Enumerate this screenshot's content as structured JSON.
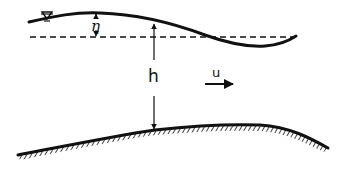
{
  "diagram": {
    "labels": {
      "water_level_symbol": "∇",
      "elevation": "η",
      "depth": "h",
      "velocity": "u"
    },
    "colors": {
      "ink": "#111111",
      "background": "#ffffff"
    }
  }
}
